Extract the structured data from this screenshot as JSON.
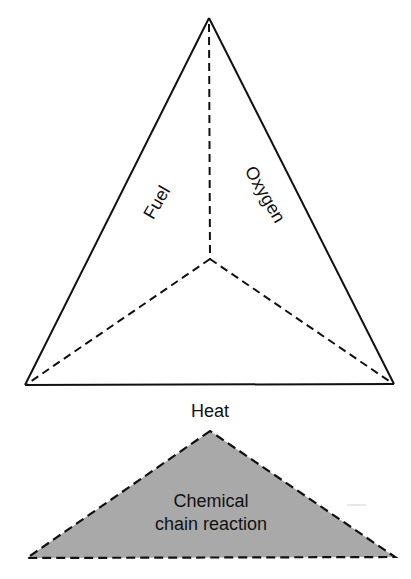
{
  "diagram": {
    "upper_tetrahedron": {
      "faces": {
        "fuel": "Fuel",
        "oxygen": "Oxygen",
        "heat": "Heat"
      },
      "vertices": {
        "apex": [
          209,
          18
        ],
        "center": [
          210,
          259
        ],
        "bottom_left": [
          25,
          385
        ],
        "bottom_right": [
          394,
          384
        ]
      }
    },
    "lower_triangle": {
      "label_line1": "Chemical",
      "label_line2": "chain reaction",
      "fill_color": "#a9a9a9",
      "vertices": {
        "apex": [
          210,
          431
        ],
        "bottom_left": [
          27,
          558
        ],
        "bottom_right": [
          395,
          557
        ]
      }
    },
    "colors": {
      "line": "#111111",
      "background": "#ffffff",
      "chain_fill": "#a9a9a9"
    }
  }
}
